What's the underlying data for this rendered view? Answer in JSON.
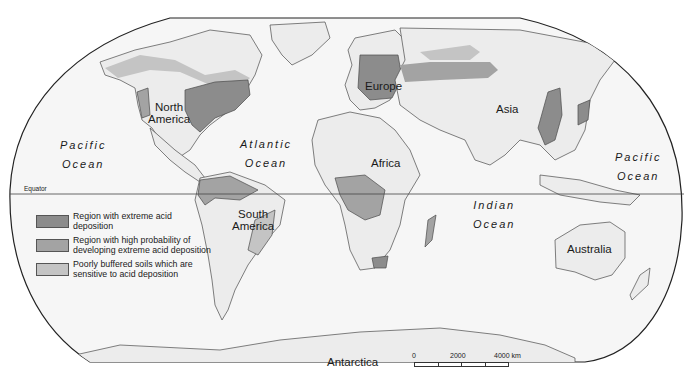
{
  "map": {
    "title": "",
    "continents": [
      {
        "id": "north-america",
        "label": "North America",
        "line1": "North",
        "line2": "America"
      },
      {
        "id": "south-america",
        "label": "South America",
        "line1": "South",
        "line2": "America"
      },
      {
        "id": "europe",
        "label": "Europe"
      },
      {
        "id": "africa",
        "label": "Africa"
      },
      {
        "id": "asia",
        "label": "Asia"
      },
      {
        "id": "australia",
        "label": "Australia"
      },
      {
        "id": "antarctica",
        "label": "Antarctica"
      }
    ],
    "oceans": [
      {
        "id": "pacific-west",
        "line1": "Pacific",
        "line2": "Ocean"
      },
      {
        "id": "atlantic",
        "line1": "Atlantic",
        "line2": "Ocean"
      },
      {
        "id": "indian",
        "line1": "Indian",
        "line2": "Ocean"
      },
      {
        "id": "pacific-east",
        "line1": "Pacific",
        "line2": "Ocean"
      }
    ],
    "equator_label": "Equator"
  },
  "legend": {
    "items": [
      {
        "label": "Region with extreme acid deposition",
        "color": "#8c8c8c"
      },
      {
        "label": "Region with high probability of developing extreme acid deposition",
        "color": "#a3a3a3"
      },
      {
        "label": "Poorly buffered soils which are sensitive to acid deposition",
        "color": "#c4c4c4"
      }
    ]
  },
  "scale_bar": {
    "ticks": [
      "0",
      "2000",
      "4000 km"
    ],
    "unit": "km"
  },
  "colors": {
    "land": "#ececec",
    "ocean": "#f6f6f6",
    "border": "#4a4a4a",
    "extreme": "#8c8c8c",
    "high": "#a3a3a3",
    "sensitive": "#c4c4c4"
  }
}
